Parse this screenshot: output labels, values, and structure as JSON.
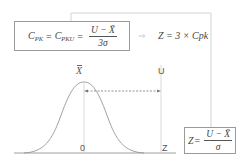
{
  "formulas": {
    "cpk": {
      "lhs": "C",
      "lhs_sub": "PK",
      "eq1": "=",
      "mid": "C",
      "mid_sub": "PKU",
      "eq2": "=",
      "numerator": "U − X̄",
      "denominator": "3σ"
    },
    "arrow": "⇒",
    "z_cpk": "Z = 3 × Cpk",
    "z_def": {
      "lhs": "Z",
      "eq": "=",
      "numerator": "U − X̄",
      "denominator": "σ"
    }
  },
  "labels": {
    "mean": "X",
    "upper": "U",
    "zero": "0",
    "z": "Z"
  },
  "colors": {
    "lines": "#9a9a9a",
    "curve": "#8a8a8a",
    "text": "#444444",
    "dashed": "#777777"
  }
}
